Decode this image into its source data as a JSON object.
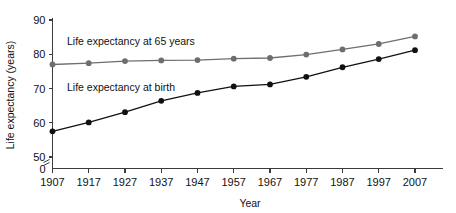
{
  "chart_data": {
    "type": "line",
    "title": "",
    "xlabel": "Year",
    "ylabel": "Life expectancy (years)",
    "x": [
      1907,
      1917,
      1927,
      1937,
      1947,
      1957,
      1967,
      1977,
      1987,
      1997,
      2007
    ],
    "xtick_labels": [
      "1907",
      "1917",
      "1927",
      "1937",
      "1947",
      "1957",
      "1967",
      "1977",
      "1987",
      "1997",
      "2007"
    ],
    "ytick_labels": [
      "0",
      "50",
      "60",
      "70",
      "80",
      "90"
    ],
    "ylim": [
      50,
      90
    ],
    "y_axis_break": true,
    "y_axis_break_note": "axis broken between 0 and 50",
    "grid": false,
    "legend_position": "inline-labels",
    "series": [
      {
        "name": "Life expectancy at 65 years",
        "color": "#6e6e6e",
        "marker": "circle",
        "label_x": 1911,
        "label_y": 82.6,
        "values": [
          77.0,
          77.4,
          78.0,
          78.2,
          78.3,
          78.7,
          78.9,
          79.9,
          81.4,
          83.0,
          85.2
        ]
      },
      {
        "name": "Life expectancy at birth",
        "color": "#111111",
        "marker": "circle",
        "label_x": 1911,
        "label_y": 69.4,
        "values": [
          57.5,
          60.1,
          63.1,
          66.4,
          68.7,
          70.6,
          71.2,
          73.4,
          76.2,
          78.6,
          81.2
        ]
      }
    ]
  },
  "axes": {
    "ylabel": "Life expectancy (years)",
    "xlabel": "Year"
  }
}
